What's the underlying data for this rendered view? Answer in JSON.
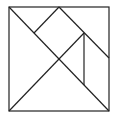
{
  "diagram": {
    "type": "tangram",
    "stroke_color": "#222222",
    "background": "#ffffff",
    "outer_square": {
      "x": 9,
      "y": 7,
      "width": 100,
      "height": 104
    },
    "segments": [
      {
        "name": "main-diagonal",
        "x1": 9,
        "y1": 7,
        "x2": 109,
        "y2": 111
      },
      {
        "name": "anti-diagonal",
        "x1": 9,
        "y1": 111,
        "x2": 84,
        "y2": 33
      },
      {
        "name": "top-left-edge",
        "x1": 59,
        "y1": 7,
        "x2": 34,
        "y2": 33
      },
      {
        "name": "top-right-edge",
        "x1": 59,
        "y1": 7,
        "x2": 109,
        "y2": 58
      },
      {
        "name": "vertical-edge",
        "x1": 84,
        "y1": 33,
        "x2": 84,
        "y2": 85
      }
    ]
  }
}
